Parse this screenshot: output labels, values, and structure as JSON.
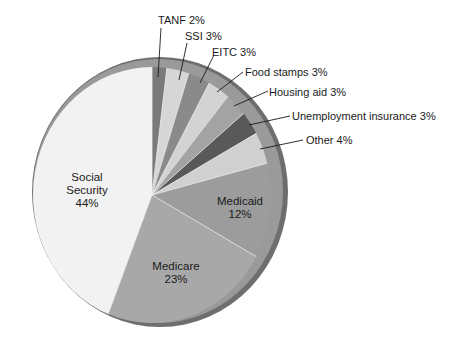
{
  "chart_data": {
    "type": "pie",
    "title": "",
    "start_angle_deg": 0,
    "direction": "clockwise",
    "slices": [
      {
        "label": "TANF",
        "value": 2,
        "display": "TANF 2%",
        "color": "#7a7a7a",
        "label_pos": "outside"
      },
      {
        "label": "SSI",
        "value": 3,
        "display": "SSI 3%",
        "color": "#d6d6d6",
        "label_pos": "outside"
      },
      {
        "label": "EITC",
        "value": 3,
        "display": "EITC 3%",
        "color": "#8a8a8a",
        "label_pos": "outside"
      },
      {
        "label": "Food stamps",
        "value": 3,
        "display": "Food stamps 3%",
        "color": "#d3d3d3",
        "label_pos": "outside"
      },
      {
        "label": "Housing aid",
        "value": 3,
        "display": "Housing aid 3%",
        "color": "#a3a3a3",
        "label_pos": "outside"
      },
      {
        "label": "Unemployment insurance",
        "value": 3,
        "display": "Unemployment insurance 3%",
        "color": "#595959",
        "label_pos": "outside"
      },
      {
        "label": "Other",
        "value": 4,
        "display": "Other 4%",
        "color": "#d0d0d0",
        "label_pos": "outside"
      },
      {
        "label": "Medicaid",
        "value": 12,
        "display_name": "Medicaid",
        "display_pct": "12%",
        "color": "#9c9c9c",
        "label_pos": "inside"
      },
      {
        "label": "Medicare",
        "value": 23,
        "display_name": "Medicare",
        "display_pct": "23%",
        "color": "#a8a8a8",
        "label_pos": "inside"
      },
      {
        "label": "Social Security",
        "value": 44,
        "display_name_1": "Social",
        "display_name_2": "Security",
        "display_pct": "44%",
        "color": "#f2f2f2",
        "label_pos": "inside"
      }
    ],
    "legend": "none",
    "units": "%"
  },
  "labels": {
    "tanf": "TANF 2%",
    "ssi": "SSI 3%",
    "eitc": "EITC 3%",
    "food": "Food stamps 3%",
    "housing": "Housing aid 3%",
    "unemp": "Unemployment insurance 3%",
    "other": "Other 4%",
    "medicaid_name": "Medicaid",
    "medicaid_pct": "12%",
    "medicare_name": "Medicare",
    "medicare_pct": "23%",
    "ss_name_1": "Social",
    "ss_name_2": "Security",
    "ss_pct": "44%"
  },
  "style": {
    "rim_color": "#8f8f8f",
    "rim_outer_color": "#6e6e6e",
    "background": "#ffffff"
  }
}
